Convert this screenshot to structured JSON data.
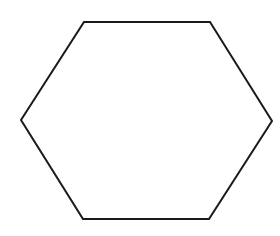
{
  "figure": {
    "shape": "hexagon",
    "stroke_color": "#1a1a1a",
    "fill_color": "#ffffff",
    "stroke_width": 2,
    "vertices": [
      [
        84,
        22
      ],
      [
        210,
        22
      ],
      [
        272,
        121
      ],
      [
        209,
        219
      ],
      [
        83,
        219
      ],
      [
        21,
        120
      ]
    ]
  }
}
